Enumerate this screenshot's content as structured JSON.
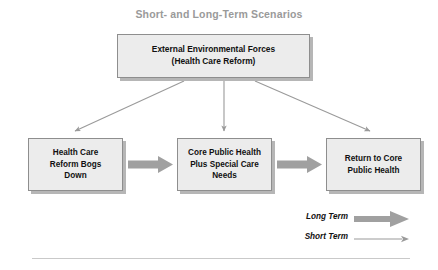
{
  "figure": {
    "title": "Short- and Long-Term Scenarios",
    "title_color": "#9a9a9a",
    "background_color": "#ffffff"
  },
  "colors": {
    "box_fill": "#ececec",
    "box_border": "#8e8e8e",
    "box_shadow": "#b6b6b6",
    "thick_arrow": "#a0a0a0",
    "thin_arrow": "#9a9a9a",
    "text": "#111111",
    "rule": "#c9c9c9"
  },
  "nodes": [
    {
      "id": "external-environmental-forces",
      "label": "External Environmental Forces\n(Health Care Reform)",
      "line1": "External Environmental Forces",
      "line2": "(Health Care Reform)"
    },
    {
      "id": "health-care-reform-bogs-down",
      "label": "Health Care\nReform Bogs\nDown"
    },
    {
      "id": "core-public-health-plus-special-care-needs",
      "label": "Core Public Health\nPlus Special Care\nNeeds"
    },
    {
      "id": "return-to-core-public-health",
      "label": "Return to Core\nPublic Health"
    }
  ],
  "connections": [
    {
      "from": "external-environmental-forces",
      "to": "health-care-reform-bogs-down",
      "type": "short-term"
    },
    {
      "from": "external-environmental-forces",
      "to": "core-public-health-plus-special-care-needs",
      "type": "short-term"
    },
    {
      "from": "external-environmental-forces",
      "to": "return-to-core-public-health",
      "type": "short-term"
    },
    {
      "from": "health-care-reform-bogs-down",
      "to": "core-public-health-plus-special-care-needs",
      "type": "long-term"
    },
    {
      "from": "core-public-health-plus-special-care-needs",
      "to": "return-to-core-public-health",
      "type": "long-term"
    }
  ],
  "legend": {
    "items": [
      {
        "id": "long-term",
        "label": "Long Term",
        "arrow": "thick-arrow-icon"
      },
      {
        "id": "short-term",
        "label": "Short Term",
        "arrow": "thin-arrow-icon"
      }
    ]
  }
}
